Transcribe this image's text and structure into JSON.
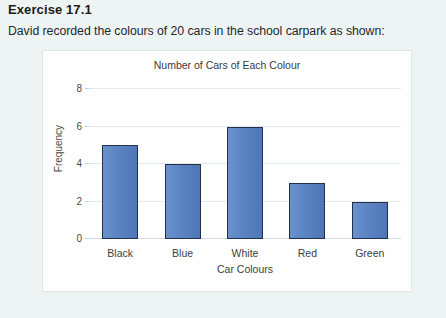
{
  "page": {
    "heading": "Exercise 17.1",
    "prompt": "David recorded the colours of 20 cars in the school carpark as shown:"
  },
  "chart_data": {
    "type": "bar",
    "title": "Number of Cars of Each Colour",
    "xlabel": "Car Colours",
    "ylabel": "Frequency",
    "categories": [
      "Black",
      "Blue",
      "White",
      "Red",
      "Green"
    ],
    "values": [
      5,
      4,
      6,
      3,
      2
    ],
    "yticks": [
      0,
      2,
      4,
      6,
      8
    ],
    "ylim": [
      0,
      8
    ],
    "grid": true,
    "legend": false,
    "bar_color": "#5b83c2",
    "bar_border_color": "#22304e",
    "total": 20
  }
}
